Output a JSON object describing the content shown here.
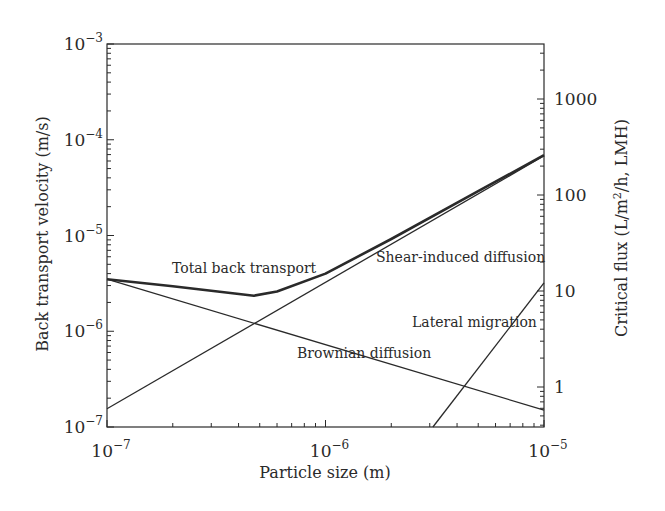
{
  "chart_data": {
    "type": "line",
    "title": "",
    "xlabel": "Particle size (m)",
    "ylabel": "Back transport velocity (m/s)",
    "y2label": "Critical flux (L/m²/h, LMH)",
    "xscale": "log",
    "yscale": "log",
    "xlim": [
      1e-07,
      1e-05
    ],
    "ylim": [
      1e-07,
      0.001
    ],
    "y2lim": [
      0.38,
      3700
    ],
    "grid": false,
    "legend": "none (inline annotations)",
    "x_ticks": [
      {
        "value": 1e-07,
        "base": "10",
        "exp": "−7"
      },
      {
        "value": 1e-06,
        "base": "10",
        "exp": "−6"
      },
      {
        "value": 1e-05,
        "base": "10",
        "exp": "−5"
      }
    ],
    "y_ticks": [
      {
        "value": 0.001,
        "base": "10",
        "exp": "−3"
      },
      {
        "value": 0.0001,
        "base": "10",
        "exp": "−4"
      },
      {
        "value": 1e-05,
        "base": "10",
        "exp": "−5"
      },
      {
        "value": 1e-06,
        "base": "10",
        "exp": "−6"
      },
      {
        "value": 1e-07,
        "base": "10",
        "exp": "−7"
      }
    ],
    "y2_ticks": [
      {
        "value": 1000,
        "label": "1000"
      },
      {
        "value": 100,
        "label": "100"
      },
      {
        "value": 10,
        "label": "10"
      },
      {
        "value": 1,
        "label": "1"
      }
    ],
    "series": [
      {
        "name": "Total back transport",
        "style": "thick",
        "x": [
          1e-07,
          2e-07,
          4.7e-07,
          6e-07,
          1e-06,
          2e-06,
          5e-06,
          1e-05
        ],
        "y": [
          3.5e-06,
          2.95e-06,
          2.35e-06,
          2.6e-06,
          4e-06,
          9.2e-06,
          2.9e-05,
          6.9e-05
        ]
      },
      {
        "name": "Shear-induced diffusion",
        "style": "thin",
        "x": [
          1e-07,
          1e-05
        ],
        "y": [
          1.55e-07,
          6.8e-05
        ]
      },
      {
        "name": "Brownian diffusion",
        "style": "thin",
        "x": [
          1e-07,
          1e-05
        ],
        "y": [
          3.5e-06,
          1.5e-07
        ]
      },
      {
        "name": "Lateral migration",
        "style": "thin",
        "x": [
          3.1e-06,
          1e-05
        ],
        "y": [
          1e-07,
          3.2e-06
        ]
      }
    ],
    "annotations": [
      {
        "text": "Total back transport",
        "x_px": 172,
        "y_px": 273
      },
      {
        "text": "Shear-induced diffusion",
        "x_px": 376,
        "y_px": 262
      },
      {
        "text": "Lateral migration",
        "x_px": 412,
        "y_px": 327
      },
      {
        "text": "Brownian diffusion",
        "x_px": 297,
        "y_px": 358
      }
    ]
  },
  "layout": {
    "plot": {
      "left": 107,
      "right": 544,
      "top": 44,
      "bottom": 427
    },
    "y2_ref": {
      "value": 1,
      "y_px": 387,
      "px_per_decade": 96
    }
  }
}
